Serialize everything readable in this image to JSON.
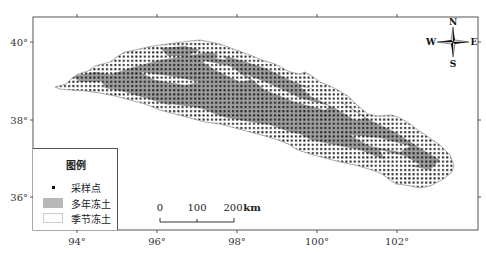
{
  "map": {
    "frame": {
      "left": 33,
      "top": 17,
      "right": 478,
      "bottom": 230
    },
    "colors": {
      "permafrost": "#9e9e9e",
      "seasonal": "#ffffff",
      "sample_dot": "#1a1a1a",
      "boundary": "#9a9a9a",
      "frame": "#555555"
    },
    "x_axis": {
      "ticks": [
        {
          "label": "94°",
          "x": 77
        },
        {
          "label": "96°",
          "x": 157
        },
        {
          "label": "98°",
          "x": 237
        },
        {
          "label": "100°",
          "x": 317
        },
        {
          "label": "102°",
          "x": 397
        }
      ]
    },
    "y_axis": {
      "ticks": [
        {
          "label": "40°",
          "y": 42
        },
        {
          "label": "38°",
          "y": 120
        },
        {
          "label": "36°",
          "y": 197
        }
      ]
    }
  },
  "legend": {
    "title": "图例",
    "items": [
      {
        "label": "采样点",
        "type": "dot"
      },
      {
        "label": "多年冻土",
        "type": "fill",
        "color": "#b8b8b8"
      },
      {
        "label": "季节冻土",
        "type": "fill",
        "color": "#ffffff"
      }
    ]
  },
  "scale_bar": {
    "labels": [
      "0",
      "100",
      "200"
    ],
    "unit": "km"
  },
  "compass": {
    "n": "N",
    "s": "S",
    "e": "E",
    "w": "W"
  }
}
